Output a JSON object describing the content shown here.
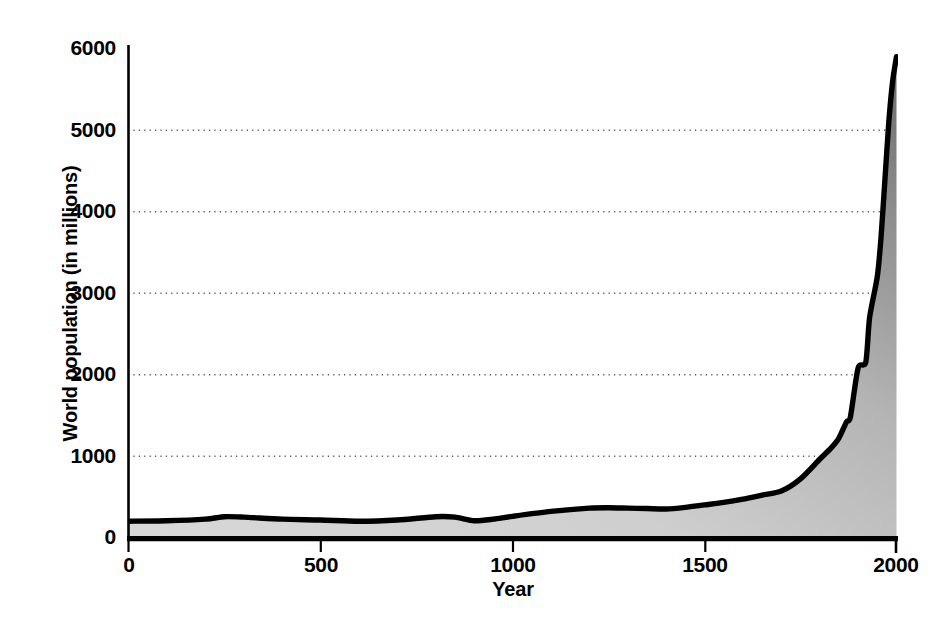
{
  "chart_data": {
    "type": "area",
    "title": "",
    "subtitle": "",
    "xlabel": "Year",
    "ylabel": "World population (in millions)",
    "xlim": [
      0,
      2000
    ],
    "ylim": [
      0,
      6000
    ],
    "xticks": [
      "0",
      "500",
      "1000",
      "1500",
      "2000"
    ],
    "xtick_values": [
      0,
      500,
      1000,
      1500,
      2000
    ],
    "yticks": [
      "0",
      "1000",
      "2000",
      "3000",
      "4000",
      "5000",
      "6000"
    ],
    "ytick_values": [
      0,
      1000,
      2000,
      3000,
      4000,
      5000,
      6000
    ],
    "grid": "horizontal-dotted",
    "legend": "none",
    "series_name": "World population",
    "line_color": "#000000",
    "fill_color_light": "#d2d2d2",
    "fill_color_dark": "#6e6e6e",
    "x": [
      0,
      100,
      200,
      250,
      300,
      400,
      500,
      600,
      700,
      800,
      850,
      900,
      950,
      1000,
      1100,
      1200,
      1250,
      1300,
      1350,
      1400,
      1450,
      1500,
      1550,
      1600,
      1650,
      1700,
      1750,
      1800,
      1830,
      1850,
      1870,
      1880,
      1900,
      1920,
      1930,
      1950,
      1960,
      1970,
      1980,
      1990,
      2000
    ],
    "values": [
      200,
      205,
      225,
      255,
      250,
      225,
      215,
      200,
      215,
      255,
      250,
      205,
      225,
      260,
      320,
      360,
      365,
      360,
      355,
      350,
      370,
      400,
      430,
      470,
      520,
      570,
      720,
      960,
      1100,
      1220,
      1420,
      1480,
      2080,
      2150,
      2700,
      3200,
      3700,
      4400,
      5100,
      5600,
      5900
    ]
  },
  "axis": {
    "y_title": "World population (in millions)",
    "x_title": "Year"
  }
}
